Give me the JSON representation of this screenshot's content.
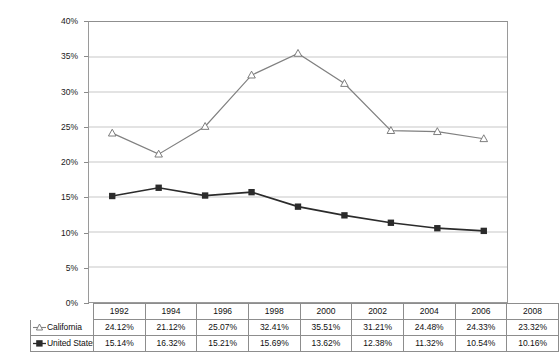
{
  "chart_data": {
    "type": "line",
    "title": "",
    "xlabel": "",
    "ylabel": "",
    "categories": [
      "1992",
      "1994",
      "1996",
      "1998",
      "2000",
      "2002",
      "2004",
      "2006",
      "2008"
    ],
    "ylim": [
      0,
      40
    ],
    "y_tick_labels": [
      "0%",
      "5%",
      "10%",
      "15%",
      "20%",
      "25%",
      "30%",
      "35%",
      "40%"
    ],
    "y_tick_values": [
      0,
      5,
      10,
      15,
      20,
      25,
      30,
      35,
      40
    ],
    "grid": true,
    "legend_position": "table-left",
    "series": [
      {
        "name": "California",
        "marker": "open-triangle",
        "color": "#808080",
        "values": [
          24.12,
          21.12,
          25.07,
          32.41,
          35.51,
          31.21,
          24.48,
          24.33,
          23.32
        ],
        "labels": [
          "24.12%",
          "21.12%",
          "25.07%",
          "32.41%",
          "35.51%",
          "31.21%",
          "24.48%",
          "24.33%",
          "23.32%"
        ]
      },
      {
        "name": "United States",
        "marker": "filled-square",
        "color": "#2b2b2b",
        "values": [
          15.14,
          16.32,
          15.21,
          15.69,
          13.62,
          12.38,
          11.32,
          10.54,
          10.16
        ],
        "labels": [
          "15.14%",
          "16.32%",
          "15.21%",
          "15.69%",
          "13.62%",
          "12.38%",
          "11.32%",
          "10.54%",
          "10.16%"
        ]
      }
    ]
  },
  "table": {
    "corner": "",
    "row_labels": [
      "California",
      "United States"
    ]
  },
  "colors": {
    "california_line": "#808080",
    "united_states_line": "#2b2b2b",
    "gridline": "#c8c8c8",
    "plot_border": "#9a9a9a",
    "table_border": "#8d8d8d",
    "text": "#101010"
  }
}
